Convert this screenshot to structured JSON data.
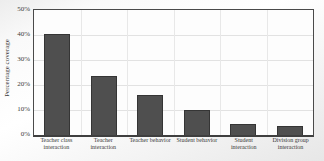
{
  "chart_data": {
    "type": "bar",
    "title": "",
    "xlabel": "",
    "ylabel": "Percentage coverage",
    "categories": [
      "Teacher class interaction",
      "Teacher interaction",
      "Teacher behavior",
      "Student behavior",
      "Student interaction",
      "Division group interaction"
    ],
    "values": [
      40.5,
      23.5,
      16,
      10,
      4.5,
      3.5
    ],
    "ylim": [
      0,
      50
    ],
    "yticks": [
      0,
      10,
      20,
      30,
      40,
      50
    ],
    "ytick_labels": [
      "0%",
      "10%",
      "20%",
      "30%",
      "40%",
      "50%"
    ],
    "grid": "on",
    "legend": "none",
    "bar_color": "#4f4f4f",
    "bar_border_color": "#353535",
    "frame_color": "#4a4a4a",
    "gridline_color": "#e2e2e2"
  }
}
